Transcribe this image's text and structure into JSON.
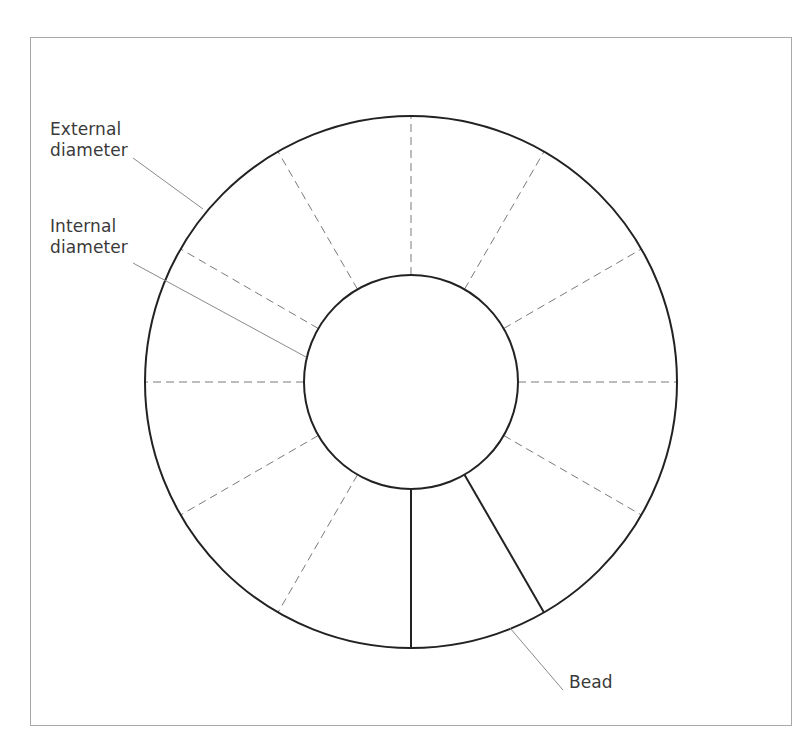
{
  "diagram": {
    "type": "annotated ring cross-section",
    "frame": {
      "x": 30,
      "y": 37,
      "width": 762,
      "height": 689,
      "stroke": "#9a9a9a"
    },
    "center": {
      "x": 411,
      "y": 382
    },
    "outer_radius": 266,
    "inner_radius": 107,
    "segments": 12,
    "segment_angle_deg": 30,
    "highlighted_segment": {
      "start_angle_deg": 150,
      "end_angle_deg": 180,
      "name": "Bead"
    },
    "colors": {
      "ring_stroke": "#222222",
      "dashed_divider": "#7a7a7a",
      "leader_line": "#8a8a8a",
      "text": "#3a3a3a",
      "background": "#ffffff"
    }
  },
  "labels": {
    "external_diameter": {
      "line1": "External",
      "line2": "diameter"
    },
    "internal_diameter": {
      "line1": "Internal",
      "line2": "diameter"
    },
    "bead": {
      "text": "Bead"
    }
  }
}
